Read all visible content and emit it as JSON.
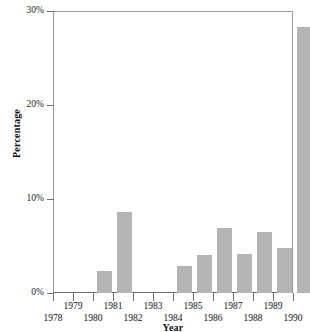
{
  "chart_data": {
    "type": "bar",
    "title": "",
    "xlabel": "Year",
    "ylabel": "Percentage",
    "categories": [
      "1978",
      "1979",
      "1980",
      "1981",
      "1982",
      "1983",
      "1984",
      "1985",
      "1986",
      "1987",
      "1988",
      "1989",
      "1990"
    ],
    "values": [
      0,
      0,
      2.3,
      8.6,
      0,
      0,
      2.9,
      4.0,
      6.9,
      4.1,
      6.5,
      4.8,
      28.3
    ],
    "series": [
      {
        "name": "Percentage",
        "values": [
          0,
          0,
          2.3,
          8.6,
          0,
          0,
          2.9,
          4.0,
          6.9,
          4.1,
          6.5,
          4.8,
          28.3
        ]
      }
    ],
    "ylim": [
      0,
      30
    ],
    "yticks": [
      0,
      10,
      20,
      30
    ],
    "ytick_labels": [
      "0%",
      "10%",
      "20%",
      "30%"
    ],
    "xtick_labels": [
      "1978",
      "1979",
      "1980",
      "1981",
      "1982",
      "1983",
      "1984",
      "1985",
      "1986",
      "1987",
      "1988",
      "1989",
      "1990"
    ],
    "xtick_label_rows": [
      "lower",
      "upper",
      "lower",
      "upper",
      "lower",
      "upper",
      "lower",
      "upper",
      "lower",
      "upper",
      "lower",
      "upper",
      "lower"
    ],
    "grid": false,
    "legend": false,
    "legend_position": "none",
    "bar_color": "#b4b4b4",
    "axis_color": "#6e6e6e",
    "frame_color": "#9a9a9a",
    "background": "#ffffff"
  }
}
